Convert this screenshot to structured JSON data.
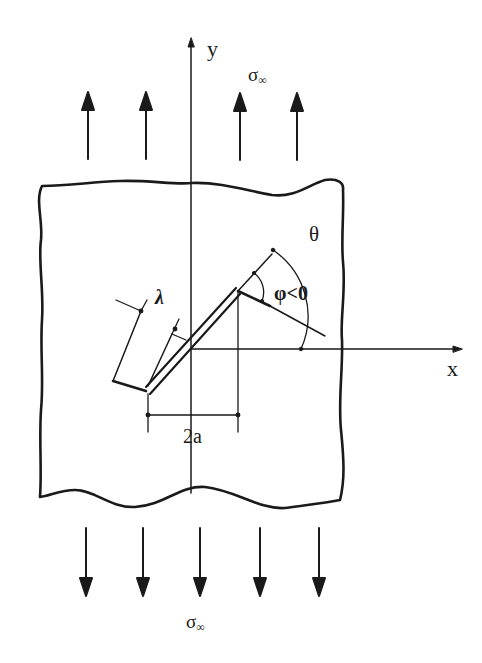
{
  "figure": {
    "stroke_color": "#1a1a1a",
    "background": "#ffffff"
  },
  "labels": {
    "y_axis": "y",
    "x_axis": "x",
    "stress_top": "σ",
    "stress_top_sub": "∞",
    "stress_bottom": "σ",
    "stress_bottom_sub": "∞",
    "theta": "θ",
    "phi": "φ<0",
    "lambda": "λ",
    "crack_length": "2a"
  },
  "arrows": {
    "top_count": 4,
    "top_direction": "up",
    "bottom_count": 5,
    "bottom_direction": "down"
  }
}
